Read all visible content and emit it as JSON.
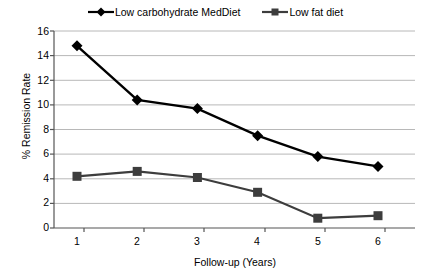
{
  "chart_data": {
    "type": "line",
    "title": "",
    "xlabel": "Follow-up (Years)",
    "ylabel": "% Remission Rate",
    "categories": [
      "1",
      "2",
      "3",
      "4",
      "5",
      "6"
    ],
    "x": [
      1,
      2,
      3,
      4,
      5,
      6
    ],
    "xlim": [
      0.5,
      6.5
    ],
    "ylim": [
      0,
      16
    ],
    "y_ticks": [
      0,
      2,
      4,
      6,
      8,
      10,
      12,
      14,
      16
    ],
    "x_ticks": [
      1,
      2,
      3,
      4,
      5,
      6
    ],
    "grid": "horizontal",
    "legend_position": "top-center",
    "series": [
      {
        "name": "Low carbohydrate MedDiet",
        "marker": "diamond",
        "color": "#000000",
        "values": [
          14.8,
          10.4,
          9.7,
          7.5,
          5.8,
          5.0
        ]
      },
      {
        "name": "Low fat diet",
        "marker": "square",
        "color": "#3d3d3d",
        "values": [
          4.2,
          4.6,
          4.1,
          2.9,
          0.8,
          1.0
        ]
      }
    ]
  },
  "legend": {
    "entries": [
      {
        "label": "Low carbohydrate MedDiet"
      },
      {
        "label": "Low fat diet"
      }
    ]
  },
  "axes": {
    "y_title": "% Remission Rate",
    "x_title": "Follow-up (Years)",
    "y_labels": [
      "16",
      "14",
      "12",
      "10",
      "8",
      "6",
      "4",
      "2",
      "0"
    ],
    "x_labels": [
      "1",
      "2",
      "3",
      "4",
      "5",
      "6"
    ]
  },
  "colors": {
    "series_1": "#000000",
    "series_2": "#3d3d3d",
    "grid": "#b8b8b8",
    "axis": "#6e6e6e",
    "background": "#ffffff"
  }
}
